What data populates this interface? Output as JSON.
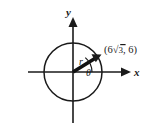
{
  "figure": {
    "type": "coordinate-diagram",
    "background_color": "#ffffff",
    "ink_color": "#1a1a1a",
    "axes": {
      "x_label": "x",
      "y_label": "y",
      "x_arrow_direction": "right",
      "y_arrow_direction": "up"
    },
    "circle": {
      "center_x": 73,
      "center_y": 72,
      "radius": 29
    },
    "ray": {
      "radius_label": "r",
      "angle_label": "θ",
      "from_x": 73,
      "from_y": 72,
      "to_x": 98,
      "to_y": 57
    },
    "point": {
      "label_open": "(",
      "x_coefficient": "6",
      "radical_symbol": "√",
      "radicand": "3",
      "separator": ", ",
      "y_value": "6",
      "label_close": ")",
      "full_label": "(6√3, 6)"
    }
  }
}
